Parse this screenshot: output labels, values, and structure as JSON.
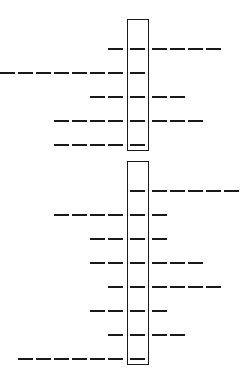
{
  "diagram": {
    "type": "dash-alignment",
    "color": "#1a1a1a",
    "dash_period_px": 18,
    "center_column_x": 130,
    "groups": [
      {
        "box": {
          "top": 19,
          "bottom": 151
        },
        "rows": [
          {
            "y": 49,
            "left": 1,
            "right": 4
          },
          {
            "y": 73,
            "left": 7,
            "right": 0
          },
          {
            "y": 97,
            "left": 2,
            "right": 2
          },
          {
            "y": 121,
            "left": 4,
            "right": 3
          },
          {
            "y": 145,
            "left": 4,
            "right": 0
          }
        ]
      },
      {
        "box": {
          "top": 161,
          "bottom": 365
        },
        "rows": [
          {
            "y": 191,
            "left": 0,
            "right": 5
          },
          {
            "y": 215,
            "left": 4,
            "right": 1
          },
          {
            "y": 239,
            "left": 2,
            "right": 1
          },
          {
            "y": 263,
            "left": 2,
            "right": 3
          },
          {
            "y": 287,
            "left": 1,
            "right": 4
          },
          {
            "y": 311,
            "left": 2,
            "right": 1
          },
          {
            "y": 335,
            "left": 1,
            "right": 2
          },
          {
            "y": 359,
            "left": 6,
            "right": 0
          }
        ]
      }
    ]
  }
}
